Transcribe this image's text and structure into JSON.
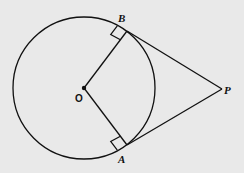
{
  "diagram": {
    "labels": {
      "center": "O",
      "point_b": "B",
      "point_a": "A",
      "point_p": "P"
    },
    "colors": {
      "background": "#e9e9e9",
      "stroke": "#111111"
    },
    "elements": [
      "circle centered at O",
      "radius OB",
      "radius OA",
      "tangent segment BP",
      "tangent segment AP",
      "right-angle marker at B",
      "right-angle marker at A"
    ]
  }
}
